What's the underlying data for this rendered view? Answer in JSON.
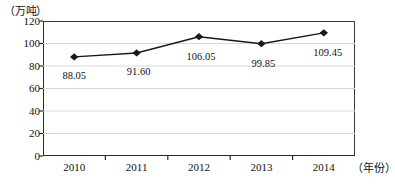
{
  "chart_data": {
    "type": "line",
    "title": "",
    "xlabel": "（年份）",
    "ylabel": "（万吨）",
    "categories": [
      "2010",
      "2011",
      "2012",
      "2013",
      "2014"
    ],
    "values": [
      88.05,
      91.6,
      106.05,
      99.85,
      109.45
    ],
    "point_labels": [
      "88.05",
      "91.60",
      "106.05",
      "99.85",
      "109.45"
    ],
    "ylim": [
      0,
      120
    ],
    "ytick_labels": [
      "120",
      "100",
      "80",
      "60",
      "40",
      "20",
      "0"
    ],
    "ytick_values": [
      120,
      100,
      80,
      60,
      40,
      20,
      0
    ],
    "gridlines": [
      20,
      40,
      60,
      80,
      100
    ],
    "grid": true,
    "legend": "none",
    "series_color": "#1a1a1a",
    "marker": "diamond",
    "gridline_color": "#d9d9d9",
    "axis_color": "#2a2a2a"
  }
}
